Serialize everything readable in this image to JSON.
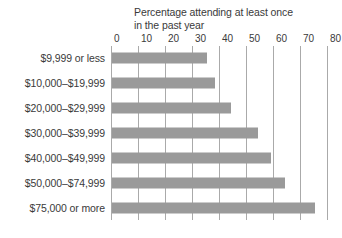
{
  "chart_data": {
    "type": "bar",
    "orientation": "horizontal",
    "title": "Percentage attending at least once in the past year",
    "title_line1": "Percentage attending at least once",
    "title_line2": "in the past year",
    "xlabel": "",
    "ylabel": "",
    "xlim": [
      0,
      80
    ],
    "xticks": [
      0,
      10,
      20,
      30,
      40,
      50,
      60,
      70,
      80
    ],
    "xtick_labels": [
      "0",
      "10",
      "20",
      "30",
      "40",
      "50",
      "60",
      "70",
      "80"
    ],
    "grid": true,
    "grid_axis": "x",
    "legend": false,
    "bar_color": "#9a9a9a",
    "grid_color": "#aaaaaa",
    "text_color": "#3a3a3a",
    "categories": [
      "$9,999 or less",
      "$10,000–$19,999",
      "$20,000–$29,999",
      "$30,000–$39,999",
      "$40,000–$49,999",
      "$50,000–$74,999",
      "$75,000 or more"
    ],
    "values": [
      35,
      38,
      44,
      54,
      59,
      64,
      75
    ]
  }
}
